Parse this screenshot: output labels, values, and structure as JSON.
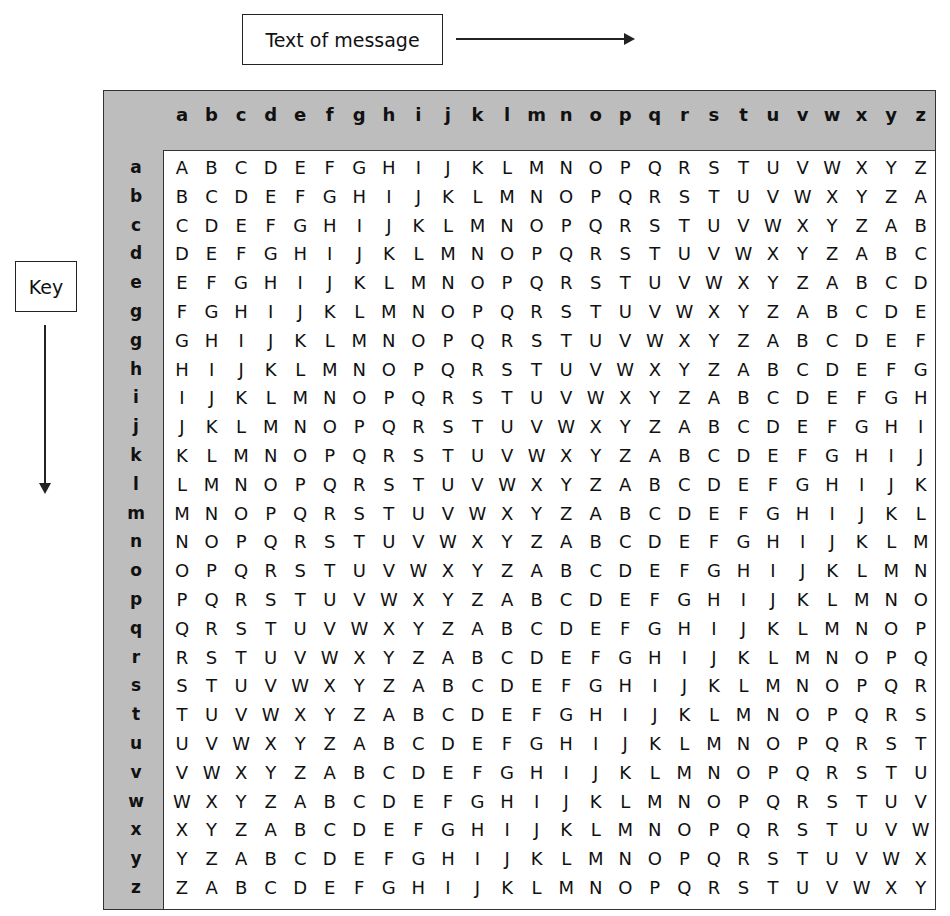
{
  "labels": {
    "message": "Text of message",
    "key": "Key"
  },
  "colors": {
    "frame": "#bdbdbd",
    "panel": "#ffffff",
    "text": "#111111"
  },
  "table": {
    "title": "Vigenère square",
    "column_headers": [
      "a",
      "b",
      "c",
      "d",
      "e",
      "f",
      "g",
      "h",
      "i",
      "j",
      "k",
      "l",
      "m",
      "n",
      "o",
      "p",
      "q",
      "r",
      "s",
      "t",
      "u",
      "v",
      "w",
      "x",
      "y",
      "z"
    ],
    "row_headers": [
      "a",
      "b",
      "c",
      "d",
      "e",
      "g",
      "g",
      "h",
      "i",
      "j",
      "k",
      "l",
      "m",
      "n",
      "o",
      "p",
      "q",
      "r",
      "s",
      "t",
      "u",
      "v",
      "w",
      "x",
      "y",
      "z"
    ],
    "rows": [
      "ABCDEFGHIJKLMNOPQRSTUVWXYZ",
      "BCDEFGHIJKLMNOPQRSTUVWXYZA",
      "CDEFGHIJKLMNOPQRSTUVWXYZAB",
      "DEFGHIJKLMNOPQRSTUVWXYZABC",
      "EFGHIJKLMNOPQRSTUVWXYZABCD",
      "FGHIJKLMNOPQRSTUVWXYZABCDE",
      "GHIJKLMNOPQRSTUVWXYZABCDEF",
      "HIJKLMNOPQRSTUVWXYZABCDEFG",
      "IJKLMNOPQRSTUVWXYZABCDEFGH",
      "JKLMNOPQRSTUVWXYZABCDEFGHI",
      "KLMNOPQRSTUVWXYZABCDEFGHIJ",
      "LMNOPQRSTUVWXYZABCDEFGHIJK",
      "MNOPQRSTUVWXYZABCDEFGHIJKL",
      "NOPQRSTUVWXYZABCDEFGHIJKLM",
      "OPQRSTUVWXYZABCDEFGHIJKLMN",
      "PQRSTUVWXYZABCDEFGHIJKLMNO",
      "QRSTUVWXYZABCDEFGHIJKLMNOP",
      "RSTUVWXYZABCDEFGHIJKLMNOPQ",
      "STUVWXYZABCDEFGHIJKLMNOPQR",
      "TUVWXYZABCDEFGHIJKLMNOPQRS",
      "UVWXYZABCDEFGHIJKLMNOPQRST",
      "VWXYZABCDEFGHIJKLMNOPQRSTU",
      "WXYZABCDEFGHIJKLMNOPQRSTUV",
      "XYZABCDEFGHIJKLMNOPQRSTUVW",
      "YZABCDEFGHIJKLMNOPQRSTUVWX",
      "ZABCDEFGHIJKLMNOPQRSTUVWXY"
    ]
  }
}
